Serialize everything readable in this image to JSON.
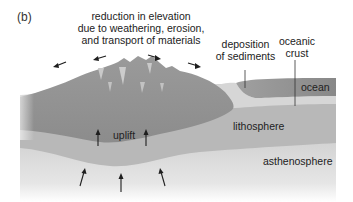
{
  "panel_label": "(b)",
  "labels": {
    "erosion_line1": "reduction in elevation",
    "erosion_line2": "due to weathering, erosion,",
    "erosion_line3": "and transport of materials",
    "deposition_line1": "deposition",
    "deposition_line2": "of sediments",
    "oceanic_line1": "oceanic",
    "oceanic_line2": "crust",
    "ocean": "ocean",
    "uplift": "uplift",
    "lithosphere": "lithosphere",
    "asthenosphere": "asthenosphere"
  },
  "colors": {
    "crust": "#9b9b9b",
    "crust_dark": "#8a8a8a",
    "lithosphere": "#b9b9b9",
    "asthenosphere_top": "#d0d0d0",
    "sediment": "#d8d8d8",
    "ocean": "#8f8f8f",
    "arrow": "#1e1e1e"
  }
}
